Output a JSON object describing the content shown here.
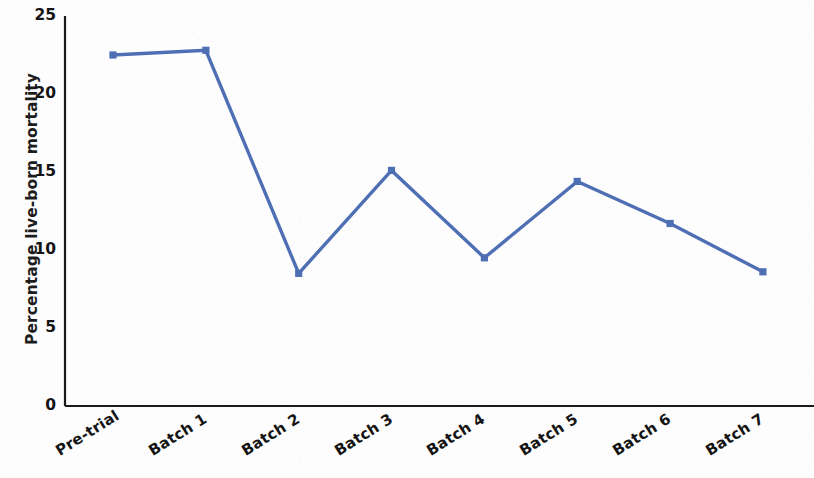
{
  "chart_data": {
    "type": "line",
    "title": "",
    "xlabel": "",
    "ylabel": "Percentage live-born mortality",
    "categories": [
      "Pre-trial",
      "Batch 1",
      "Batch 2",
      "Batch 3",
      "Batch 4",
      "Batch 5",
      "Batch 6",
      "Batch 7"
    ],
    "values": [
      22.5,
      22.8,
      8.5,
      15.1,
      9.5,
      14.4,
      11.7,
      8.6
    ],
    "ylim": [
      0,
      25
    ],
    "ytick_labels": [
      "25",
      "20",
      "15",
      "10",
      "5",
      "0"
    ],
    "ytick_values": [
      25,
      20,
      15,
      10,
      5,
      0
    ],
    "grid": false,
    "legend": false,
    "series_color": "#4f6fb5",
    "marker": "square",
    "axis_color": "#1a1a1a"
  }
}
